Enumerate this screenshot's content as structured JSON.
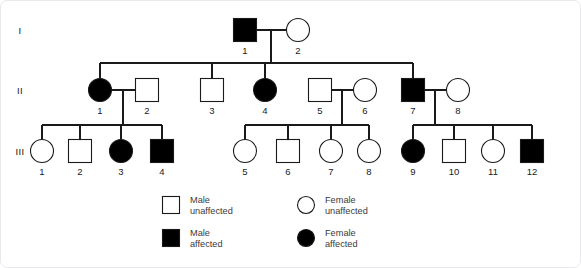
{
  "figure": {
    "attribution": "Adapted from https://www.genome.gov/genetics-glossary/Autosomal-Dominant-Disorder",
    "line_color": "#1a1a1a",
    "affected_color": "#000000",
    "unaffected_color": "#ffffff",
    "background_color": "#ffffff"
  },
  "generations": [
    {
      "id": "gen-1",
      "label": "I"
    },
    {
      "id": "gen-2",
      "label": "II"
    },
    {
      "id": "gen-3",
      "label": "III"
    }
  ],
  "individuals": [
    {
      "id": "I-1",
      "generation": "I",
      "number": "1",
      "sex": "male",
      "status": "affected",
      "x": 244,
      "y": 29
    },
    {
      "id": "I-2",
      "generation": "I",
      "number": "2",
      "sex": "female",
      "status": "unaffected",
      "x": 297,
      "y": 29
    },
    {
      "id": "II-1",
      "generation": "II",
      "number": "1",
      "sex": "female",
      "status": "affected",
      "x": 99,
      "y": 89
    },
    {
      "id": "II-2",
      "generation": "II",
      "number": "2",
      "sex": "male",
      "status": "unaffected",
      "x": 146,
      "y": 89
    },
    {
      "id": "II-3",
      "generation": "II",
      "number": "3",
      "sex": "male",
      "status": "unaffected",
      "x": 211,
      "y": 89
    },
    {
      "id": "II-4",
      "generation": "II",
      "number": "4",
      "sex": "female",
      "status": "affected",
      "x": 264,
      "y": 89
    },
    {
      "id": "II-5",
      "generation": "II",
      "number": "5",
      "sex": "male",
      "status": "unaffected",
      "x": 319,
      "y": 89
    },
    {
      "id": "II-6",
      "generation": "II",
      "number": "6",
      "sex": "female",
      "status": "unaffected",
      "x": 364,
      "y": 89
    },
    {
      "id": "II-7",
      "generation": "II",
      "number": "7",
      "sex": "male",
      "status": "affected",
      "x": 412,
      "y": 89
    },
    {
      "id": "II-8",
      "generation": "II",
      "number": "8",
      "sex": "female",
      "status": "unaffected",
      "x": 457,
      "y": 89
    },
    {
      "id": "III-1",
      "generation": "III",
      "number": "1",
      "sex": "female",
      "status": "unaffected",
      "x": 41,
      "y": 150
    },
    {
      "id": "III-2",
      "generation": "III",
      "number": "2",
      "sex": "male",
      "status": "unaffected",
      "x": 79,
      "y": 150
    },
    {
      "id": "III-3",
      "generation": "III",
      "number": "3",
      "sex": "female",
      "status": "affected",
      "x": 120,
      "y": 150
    },
    {
      "id": "III-4",
      "generation": "III",
      "number": "4",
      "sex": "male",
      "status": "affected",
      "x": 161,
      "y": 150
    },
    {
      "id": "III-5",
      "generation": "III",
      "number": "5",
      "sex": "female",
      "status": "unaffected",
      "x": 244,
      "y": 150
    },
    {
      "id": "III-6",
      "generation": "III",
      "number": "6",
      "sex": "male",
      "status": "unaffected",
      "x": 287,
      "y": 150
    },
    {
      "id": "III-7",
      "generation": "III",
      "number": "7",
      "sex": "female",
      "status": "unaffected",
      "x": 330,
      "y": 150
    },
    {
      "id": "III-8",
      "generation": "III",
      "number": "8",
      "sex": "female",
      "status": "unaffected",
      "x": 368,
      "y": 150
    },
    {
      "id": "III-9",
      "generation": "III",
      "number": "9",
      "sex": "female",
      "status": "affected",
      "x": 412,
      "y": 150
    },
    {
      "id": "III-10",
      "generation": "III",
      "number": "10",
      "sex": "male",
      "status": "unaffected",
      "x": 453,
      "y": 150
    },
    {
      "id": "III-11",
      "generation": "III",
      "number": "11",
      "sex": "female",
      "status": "unaffected",
      "x": 492,
      "y": 150
    },
    {
      "id": "III-12",
      "generation": "III",
      "number": "12",
      "sex": "male",
      "status": "affected",
      "x": 531,
      "y": 150
    }
  ],
  "legend": {
    "items": [
      {
        "id": "legend-male-unaffected",
        "sex": "male",
        "status": "unaffected",
        "line1": "Male",
        "line2": "unaffected"
      },
      {
        "id": "legend-male-affected",
        "sex": "male",
        "status": "affected",
        "line1": "Male",
        "line2": "affected"
      },
      {
        "id": "legend-female-unaffected",
        "sex": "female",
        "status": "unaffected",
        "line1": "Female",
        "line2": "unaffected"
      },
      {
        "id": "legend-female-affected",
        "sex": "female",
        "status": "affected",
        "line1": "Female",
        "line2": "affected"
      }
    ]
  }
}
